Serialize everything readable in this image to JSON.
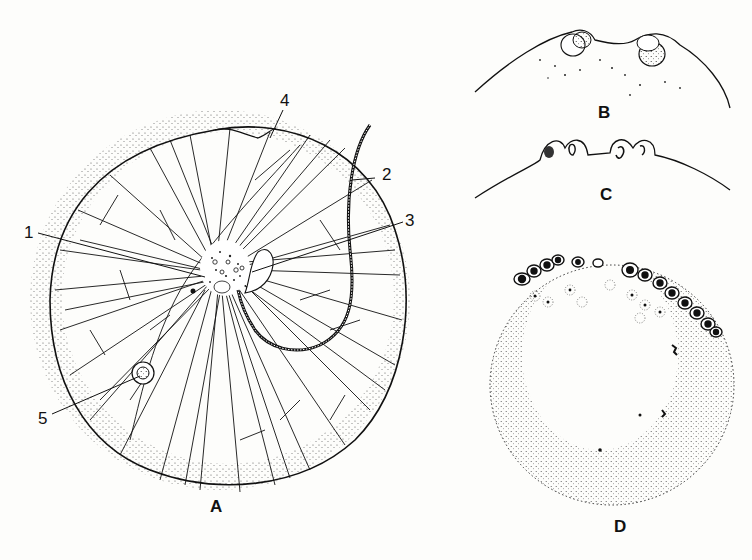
{
  "figure": {
    "background_color": "#fdfdfb",
    "ink_color": "#111111"
  },
  "panels": [
    {
      "id": "A",
      "label": "A",
      "description": "Whole spherical cell with radiating cytoplasmic strands, central cytoplasm, tentacle"
    },
    {
      "id": "B",
      "label": "B",
      "description": "Surface bulge with two nuclei"
    },
    {
      "id": "C",
      "label": "C",
      "description": "Surface bulge with four small buds"
    },
    {
      "id": "D",
      "label": "D",
      "description": "Stippled sphere with cluster of buds / swarmers at top"
    }
  ],
  "callouts": [
    {
      "number": "1",
      "target": "central cytoplasm"
    },
    {
      "number": "2",
      "target": "tentacle"
    },
    {
      "number": "3",
      "target": "flagellum/oral region"
    },
    {
      "number": "4",
      "target": "cytostome groove"
    },
    {
      "number": "5",
      "target": "food vacuole"
    }
  ]
}
